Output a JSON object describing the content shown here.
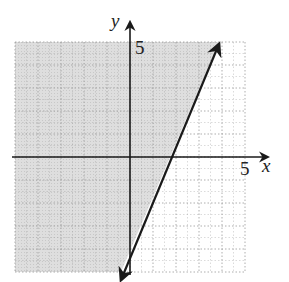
{
  "chart_data": {
    "type": "line",
    "title": "",
    "xlabel": "x",
    "ylabel": "y",
    "xlim": [
      -5,
      5
    ],
    "ylim": [
      -5,
      5
    ],
    "grid": true,
    "tick_labels": {
      "x": [
        "5"
      ],
      "y": [
        "5"
      ]
    },
    "series": [
      {
        "name": "boundary line (estimated from pixels)",
        "style": "solid",
        "arrows": "both ends",
        "points": [
          [
            -0.4,
            -5.3
          ],
          [
            3.9,
            4.9
          ]
        ],
        "approx_slope": 2.5,
        "approx_y_intercept": -4.5,
        "approx_x_intercept": 1.8
      }
    ],
    "shaded_region": {
      "description": "region to the left of / above the line",
      "color": "#d9d9d9"
    }
  },
  "labels": {
    "x_axis": "x",
    "y_axis": "y",
    "x_tick_5": "5",
    "y_tick_5": "5"
  },
  "colors": {
    "axis": "#1a1a1a",
    "grid": "#9a9a9a",
    "shade": "#d9d9d9",
    "line": "#1a1a1a"
  }
}
